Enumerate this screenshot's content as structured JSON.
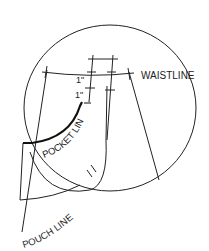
{
  "diagram": {
    "labels": {
      "waistline": "WAISTLINE",
      "pocket_line": "POCKET LINE",
      "pouch_line": "POUCH LINE",
      "measure_1": "1\"",
      "measure_2": "1\""
    },
    "colors": {
      "line": "#222222",
      "background": "#ffffff"
    }
  }
}
